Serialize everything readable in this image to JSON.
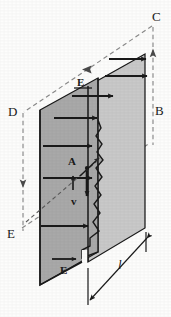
{
  "figure": {
    "kind": "physics-diagram",
    "background_color": "#fdfdfc",
    "ink_color": "#1a1a1a",
    "face_left_color": "#a9a9a9",
    "face_right_color": "#c9c9c9",
    "dashed_color": "#8a8a8a"
  },
  "labels": {
    "corner_c": "C",
    "corner_b": "B",
    "corner_d": "D",
    "corner_e": "E",
    "field_top": "E",
    "field_bottom": "E",
    "area": "A",
    "velocity": "v",
    "length": "l"
  },
  "annotations": {
    "field_vector_symbol": "E",
    "area_symbol": "A",
    "velocity_symbol": "v",
    "length_symbol": "l",
    "corner_sequence": [
      "D",
      "C",
      "B",
      "E"
    ]
  },
  "geometry": {
    "arrow_rows_count": 8,
    "crack_segments": 11,
    "view": "oblique-projection"
  }
}
